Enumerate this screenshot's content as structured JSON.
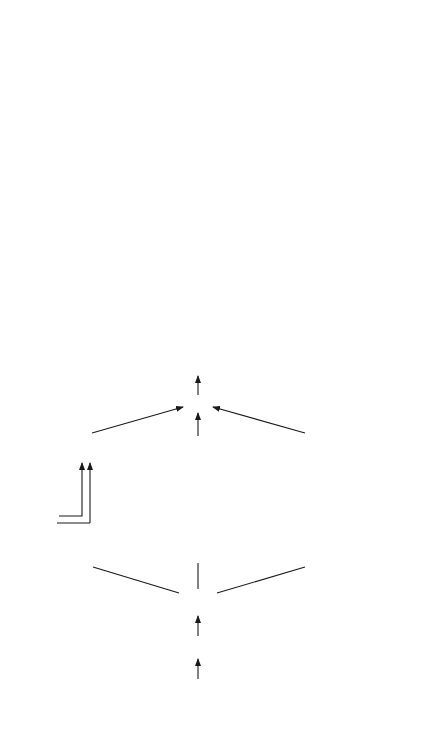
{
  "er": {
    "title": "Endoplasmic Reticulum",
    "chain": [
      "NAD(P)H",
      "Fp",
      "cyt b5"
    ],
    "chain_sub": {
      "cyt": "cyt b",
      "sub": "5"
    },
    "branches": [
      {
        "organism": [
          "mammals, yeasts",
          "Limnanthes"
        ],
        "deltas": [
          "Δ 9",
          "Δ 5"
        ],
        "substrates": [
          "16:0,18:0-CoA",
          "20:0-CoA"
        ],
        "enzyme": "desaturase"
      },
      {
        "organism": [
          "insects",
          "mammals"
        ],
        "deltas": [
          "Δ12",
          "Δ 6",
          "Δ 5"
        ],
        "substrates": [
          "18:1-CoA",
          "18:2-CoA",
          "20:3-CoA"
        ],
        "enzyme": "desaturase"
      },
      {
        "organism": [
          "plants",
          "yeasts"
        ],
        "deltas": [
          "Δ12",
          "Δ15",
          "Δ 6"
        ],
        "substrates": [
          "18:1-PC",
          "18:2-PC",
          "18:2-PC"
        ],
        "enzyme": "desaturase"
      }
    ],
    "o2": {
      "base": "O",
      "sub": "2"
    },
    "h2o": {
      "a": "H",
      "sub": "2",
      "b": "O"
    },
    "notes": [
      [
        "first",
        "double bond"
      ],
      [
        "second and further",
        "double bonds"
      ]
    ]
  },
  "cp": {
    "title_line1": "Chloroplasts",
    "title_line2": "Mycobacterium, Cyanobacteria",
    "chain": [
      "NADPH",
      "FNR",
      "Fd"
    ],
    "branches": [
      {
        "organism": [
          "stroma",
          "cytoplasm"
        ],
        "deltas": [
          "Δ 9",
          "Δ15"
        ],
        "substrates": [
          "18:0-ACP",
          "24:0-CoA"
        ],
        "enzyme": "desaturase"
      },
      {
        "organism": [
          "envelope"
        ],
        "deltas": [
          "Δ 7",
          "n-6",
          "n-3"
        ],
        "substrates": [
          "16:0-MGD",
          "18:1,16:1-MGD",
          "18:2,16:2-MGD"
        ],
        "enzyme": "desaturase"
      },
      {
        "organism": [
          "membranes"
        ],
        "deltas": [
          "Δ 9",
          "Δ12",
          "Δ15",
          "Δ 6"
        ],
        "substrates": [
          "18:0,16:0-MGD",
          "18:1,16:1-MGD",
          "18:2-MGD",
          "18:2-MGD"
        ],
        "enzyme": "desaturase"
      }
    ],
    "o2": {
      "base": "O",
      "sub": "2"
    },
    "h2o": {
      "a": "H",
      "sub": "2",
      "b": "O"
    },
    "notes": [
      [
        "first",
        "double bond"
      ],
      [
        "first and further",
        "double bonds"
      ]
    ]
  },
  "colors": {
    "ink": "#1a1a1a",
    "background": "#ffffff"
  }
}
